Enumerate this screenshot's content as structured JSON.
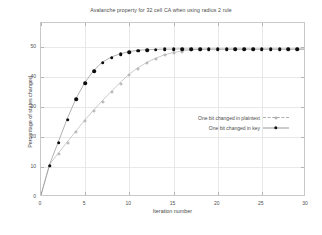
{
  "chart_data": {
    "type": "line",
    "title": "Avalanche property for 32 cell CA when using radius 2 rule",
    "xlabel": "Iteration number",
    "ylabel": "Percentage of states changed",
    "xlim": [
      0,
      30
    ],
    "ylim": [
      0,
      58
    ],
    "xticks": [
      0,
      5,
      10,
      15,
      20,
      25,
      30
    ],
    "yticks": [
      0,
      10,
      20,
      30,
      40,
      50
    ],
    "grid": true,
    "legend_position": "center-right-inside",
    "x": [
      0,
      1,
      2,
      3,
      4,
      5,
      6,
      7,
      8,
      9,
      10,
      11,
      12,
      13,
      14,
      15,
      16,
      17,
      18,
      19,
      20,
      21,
      22,
      23,
      24,
      25,
      26,
      27,
      28,
      29,
      30
    ],
    "series": [
      {
        "name": "One bit changed in plaintext",
        "color": "#a6a6a6",
        "marker": "open-circle",
        "values": [
          0,
          10.4,
          14.2,
          17.9,
          21.6,
          25.3,
          28.6,
          31.8,
          34.9,
          37.8,
          40.6,
          42.8,
          44.6,
          46.0,
          47.2,
          48.0,
          48.5,
          48.9,
          49.1,
          49.2,
          49.2,
          49.2,
          49.2,
          49.2,
          49.2,
          49.2,
          49.2,
          49.2,
          49.2,
          49.2,
          49.2
        ]
      },
      {
        "name": "One bit changed in key",
        "color": "#0d0d0d",
        "marker": "filled-circle",
        "values": [
          0,
          10.5,
          18.1,
          25.8,
          32.6,
          37.9,
          42.0,
          44.8,
          46.5,
          47.6,
          48.3,
          48.8,
          49.0,
          49.1,
          49.2,
          49.2,
          49.3,
          49.2,
          49.2,
          49.2,
          49.2,
          49.2,
          49.2,
          49.2,
          49.2,
          49.2,
          49.2,
          49.2,
          49.2,
          49.2,
          49.2
        ]
      }
    ]
  },
  "xtick_labels": [
    "0",
    "5",
    "10",
    "15",
    "20",
    "25",
    "30"
  ],
  "ytick_labels": [
    "0",
    "10",
    "20",
    "30",
    "40",
    "50"
  ]
}
